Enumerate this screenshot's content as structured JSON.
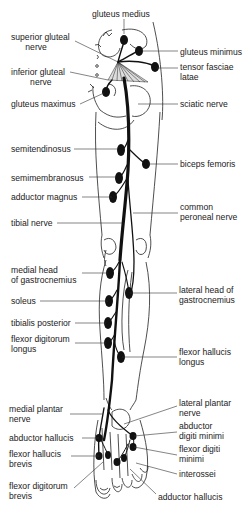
{
  "colors": {
    "line": "#222222",
    "nerve": "#111111",
    "background": "#ffffff"
  },
  "labels": [
    {
      "id": "gluteus-medius",
      "text": "gluteus medius",
      "x": 92,
      "y": 9,
      "align": "left",
      "lead": [
        [
          124,
          19
        ],
        [
          124,
          34
        ]
      ]
    },
    {
      "id": "superior-gluteal-nerve",
      "text": "superior gluteal\n      nerve",
      "x": 11,
      "y": 32,
      "align": "left",
      "lead": [
        [
          75,
          41
        ],
        [
          118,
          62
        ]
      ]
    },
    {
      "id": "gluteus-minimus",
      "text": "gluteus minimus",
      "x": 180,
      "y": 47,
      "align": "left",
      "lead": [
        [
          178,
          51
        ],
        [
          142,
          51
        ]
      ]
    },
    {
      "id": "tensor-fasciae-latae",
      "text": "tensor fasciae\nlatae",
      "x": 180,
      "y": 62,
      "align": "left",
      "lead": [
        [
          178,
          68
        ],
        [
          157,
          68
        ]
      ]
    },
    {
      "id": "inferior-gluteal-nerve",
      "text": "inferior gluteal\n        nerve",
      "x": 11,
      "y": 67,
      "align": "left",
      "lead": [
        [
          70,
          72
        ],
        [
          108,
          80
        ]
      ]
    },
    {
      "id": "gluteus-maximus",
      "text": "gluteus maximus",
      "x": 11,
      "y": 99,
      "align": "left",
      "lead": [
        [
          80,
          104
        ],
        [
          104,
          93
        ]
      ]
    },
    {
      "id": "sciatic-nerve",
      "text": "sciatic nerve",
      "x": 180,
      "y": 99,
      "align": "left",
      "lead": [
        [
          178,
          104
        ],
        [
          138,
          104
        ]
      ]
    },
    {
      "id": "semitendinosus",
      "text": "semitendinosus",
      "x": 11,
      "y": 144,
      "align": "left",
      "lead": [
        [
          74,
          149
        ],
        [
          118,
          149
        ]
      ]
    },
    {
      "id": "biceps-femoris",
      "text": "biceps femoris",
      "x": 180,
      "y": 159,
      "align": "left",
      "lead": [
        [
          178,
          164
        ],
        [
          148,
          164
        ]
      ]
    },
    {
      "id": "semimembranosus",
      "text": "semimembranosus",
      "x": 11,
      "y": 173,
      "align": "left",
      "lead": [
        [
          89,
          177
        ],
        [
          116,
          177
        ]
      ]
    },
    {
      "id": "adductor-magnus",
      "text": "adductor magnus",
      "x": 11,
      "y": 192,
      "align": "left",
      "lead": [
        [
          82,
          197
        ],
        [
          112,
          197
        ]
      ]
    },
    {
      "id": "common-peroneal-nerve",
      "text": "common\nperoneal nerve",
      "x": 180,
      "y": 202,
      "align": "left",
      "lead": [
        [
          178,
          213
        ],
        [
          133,
          213
        ]
      ]
    },
    {
      "id": "tibial-nerve",
      "text": "tibial nerve",
      "x": 11,
      "y": 218,
      "align": "left",
      "lead": [
        [
          57,
          223
        ],
        [
          122,
          223
        ]
      ]
    },
    {
      "id": "medial-head-gastrocnemius",
      "text": "medial head\nof gastrocnemius",
      "x": 11,
      "y": 265,
      "align": "left",
      "lead": [
        [
          82,
          273
        ],
        [
          108,
          273
        ]
      ]
    },
    {
      "id": "lateral-head-gastrocnemius",
      "text": "lateral head of\ngastrocnemius",
      "x": 179,
      "y": 285,
      "align": "left",
      "lead": [
        [
          177,
          293
        ],
        [
          130,
          293
        ]
      ]
    },
    {
      "id": "soleus",
      "text": "soleus",
      "x": 11,
      "y": 296,
      "align": "left",
      "lead": [
        [
          40,
          301
        ],
        [
          108,
          301
        ]
      ]
    },
    {
      "id": "tibialis-posterior",
      "text": "tibialis posterior",
      "x": 11,
      "y": 318,
      "align": "left",
      "lead": [
        [
          75,
          323
        ],
        [
          106,
          323
        ]
      ]
    },
    {
      "id": "flexor-digitorum-longus",
      "text": "flexor digitorum\nlongus",
      "x": 11,
      "y": 334,
      "align": "left",
      "lead": [
        [
          75,
          343
        ],
        [
          106,
          343
        ]
      ]
    },
    {
      "id": "flexor-hallucis-longus",
      "text": "flexor hallucis\nlongus",
      "x": 179,
      "y": 347,
      "align": "left",
      "lead": [
        [
          177,
          357
        ],
        [
          122,
          357
        ]
      ]
    },
    {
      "id": "medial-plantar-nerve",
      "text": "medial plantar\nnerve",
      "x": 9,
      "y": 404,
      "align": "left",
      "lead": [
        [
          70,
          414
        ],
        [
          103,
          414
        ]
      ]
    },
    {
      "id": "lateral-plantar-nerve",
      "text": "lateral plantar\nnerve",
      "x": 179,
      "y": 398,
      "align": "left",
      "lead": [
        [
          177,
          406
        ],
        [
          124,
          424
        ]
      ]
    },
    {
      "id": "abductor-digiti-minimi",
      "text": "abductor\ndigiti minimi",
      "x": 179,
      "y": 421,
      "align": "left",
      "lead": [
        [
          177,
          432
        ],
        [
          134,
          436
        ]
      ]
    },
    {
      "id": "abductor-hallucis",
      "text": "abductor hallucis",
      "x": 9,
      "y": 433,
      "align": "left",
      "lead": [
        [
          82,
          438
        ],
        [
          99,
          438
        ]
      ]
    },
    {
      "id": "flexor-digiti-minimi",
      "text": "flexor digiti\nminimi",
      "x": 179,
      "y": 444,
      "align": "left",
      "lead": [
        [
          177,
          455
        ],
        [
          134,
          447
        ]
      ]
    },
    {
      "id": "flexor-hallucis-brevis",
      "text": "flexor hallucis\nbrevis",
      "x": 9,
      "y": 449,
      "align": "left",
      "lead": [
        [
          71,
          456
        ],
        [
          99,
          456
        ]
      ]
    },
    {
      "id": "interossei",
      "text": "interossei",
      "x": 179,
      "y": 469,
      "align": "left",
      "lead": [
        [
          177,
          474
        ],
        [
          136,
          463
        ]
      ]
    },
    {
      "id": "flexor-digitorum-brevis",
      "text": "flexor digitorum\nbrevis",
      "x": 9,
      "y": 481,
      "align": "left",
      "lead": [
        [
          74,
          488
        ],
        [
          103,
          462
        ]
      ]
    },
    {
      "id": "adductor-hallucis",
      "text": "adductor hallucis",
      "x": 158,
      "y": 492,
      "align": "left",
      "lead": [
        [
          156,
          494
        ],
        [
          130,
          469
        ]
      ]
    }
  ],
  "muscle_dots": [
    {
      "id": "gluteus-medius",
      "cx": 124,
      "cy": 40,
      "rx": 4,
      "ry": 5
    },
    {
      "id": "gluteus-minimus",
      "cx": 139,
      "cy": 51,
      "rx": 4,
      "ry": 5
    },
    {
      "id": "tensor-fasciae-latae",
      "cx": 155,
      "cy": 67,
      "rx": 4,
      "ry": 5
    },
    {
      "id": "gluteus-maximus",
      "cx": 106,
      "cy": 92,
      "rx": 4,
      "ry": 5
    },
    {
      "id": "semitendinosus",
      "cx": 121,
      "cy": 150,
      "rx": 4,
      "ry": 6
    },
    {
      "id": "biceps-femoris",
      "cx": 146,
      "cy": 164,
      "rx": 4,
      "ry": 5
    },
    {
      "id": "semimembranosus",
      "cx": 119,
      "cy": 178,
      "rx": 4,
      "ry": 6
    },
    {
      "id": "adductor-magnus",
      "cx": 113,
      "cy": 197,
      "rx": 4,
      "ry": 6
    },
    {
      "id": "medial-head-gastrocnemius",
      "cx": 110,
      "cy": 273,
      "rx": 4,
      "ry": 6
    },
    {
      "id": "lateral-head-gastrocnemius",
      "cx": 129,
      "cy": 293,
      "rx": 4,
      "ry": 6
    },
    {
      "id": "soleus",
      "cx": 109,
      "cy": 301,
      "rx": 4,
      "ry": 6
    },
    {
      "id": "tibialis-posterior",
      "cx": 108,
      "cy": 323,
      "rx": 4,
      "ry": 6
    },
    {
      "id": "flexor-digitorum-longus",
      "cx": 108,
      "cy": 343,
      "rx": 4,
      "ry": 6
    },
    {
      "id": "flexor-hallucis-longus",
      "cx": 121,
      "cy": 357,
      "rx": 4,
      "ry": 6
    },
    {
      "id": "abductor-digiti-minimi",
      "cx": 133,
      "cy": 436,
      "rx": 3.5,
      "ry": 4
    },
    {
      "id": "abductor-hallucis",
      "cx": 99,
      "cy": 438,
      "rx": 3.5,
      "ry": 4
    },
    {
      "id": "flexor-digiti-minimi",
      "cx": 133,
      "cy": 447,
      "rx": 3.5,
      "ry": 4
    },
    {
      "id": "flexor-hallucis-brevis-1",
      "cx": 99,
      "cy": 456,
      "rx": 3.5,
      "ry": 4
    },
    {
      "id": "flexor-hallucis-brevis-2",
      "cx": 108,
      "cy": 455,
      "rx": 3,
      "ry": 4
    },
    {
      "id": "interossei",
      "cx": 124,
      "cy": 458,
      "rx": 3,
      "ry": 4
    },
    {
      "id": "flexor-digitorum-brevis",
      "cx": 117,
      "cy": 462,
      "rx": 3.5,
      "ry": 4
    }
  ]
}
